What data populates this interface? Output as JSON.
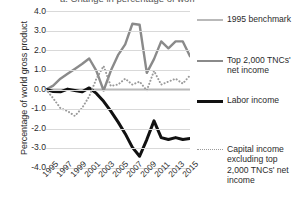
{
  "chart_data": {
    "type": "line",
    "title": "a. Change in percentage of world gross product",
    "xlabel": "",
    "ylabel": "Percentage of world gross product",
    "x": [
      1995,
      1996,
      1997,
      1998,
      1999,
      2000,
      2001,
      2002,
      2003,
      2004,
      2005,
      2006,
      2007,
      2008,
      2009,
      2010,
      2011,
      2012,
      2013,
      2014,
      2015
    ],
    "xtick_labels": [
      "1995",
      "1997",
      "1999",
      "2001",
      "2003",
      "2005",
      "2007",
      "2009",
      "2011",
      "2013",
      "2015"
    ],
    "ytick_labels": [
      "4.0",
      "3.0",
      "2.0",
      "1.0",
      "0.0",
      "-1.0",
      "-2.0",
      "-3.0",
      "-4.0"
    ],
    "ylim": [
      -4.0,
      4.0
    ],
    "xlim": [
      1995,
      2015
    ],
    "grid": true,
    "legend_position": "right",
    "series": [
      {
        "name": "1995 benchmark",
        "style": "solid",
        "color": "#b9b9b9",
        "width": 2,
        "values": [
          0.0,
          0.0,
          0.0,
          0.0,
          0.0,
          0.0,
          0.0,
          0.0,
          0.0,
          0.0,
          0.0,
          0.0,
          0.0,
          0.0,
          0.0,
          0.0,
          0.0,
          0.0,
          0.0,
          0.0,
          0.0
        ]
      },
      {
        "name": "Top 2,000 TNCs' net income",
        "style": "solid",
        "color": "#8a8a8a",
        "width": 2.4,
        "values": [
          0.0,
          0.2,
          0.55,
          0.8,
          1.05,
          1.3,
          1.58,
          0.95,
          -0.05,
          0.95,
          1.75,
          2.3,
          3.35,
          3.3,
          0.85,
          1.55,
          2.45,
          2.1,
          2.45,
          2.45,
          1.7
        ]
      },
      {
        "name": "Labor income",
        "style": "solid",
        "color": "#111111",
        "width": 3,
        "values": [
          0.0,
          -0.1,
          -0.12,
          0.02,
          -0.05,
          -0.12,
          0.08,
          -0.2,
          -0.6,
          -1.1,
          -1.65,
          -2.25,
          -2.95,
          -3.4,
          -2.55,
          -1.6,
          -2.45,
          -2.55,
          -2.45,
          -2.55,
          -2.5
        ]
      },
      {
        "name": "Capital income excluding top 2,000 TNCs' net income",
        "style": "dotted",
        "color": "#9a9a9a",
        "width": 1.8,
        "values": [
          0.0,
          -0.45,
          -0.95,
          -1.1,
          -1.35,
          -0.95,
          -0.35,
          0.55,
          1.2,
          0.18,
          0.25,
          0.55,
          0.25,
          0.4,
          -0.05,
          0.95,
          0.25,
          0.4,
          0.55,
          0.3,
          0.72
        ]
      }
    ]
  },
  "legend": {
    "items": [
      {
        "label": "1995 benchmark",
        "swatch": "sw-solid-light"
      },
      {
        "label": "Top 2,000 TNCs' net income",
        "swatch": "sw-solid-gray"
      },
      {
        "label": "Labor income",
        "swatch": "sw-solid-black"
      },
      {
        "label": "Capital income excluding top 2,000 TNCs' net income",
        "swatch": "sw-dotted"
      }
    ]
  }
}
